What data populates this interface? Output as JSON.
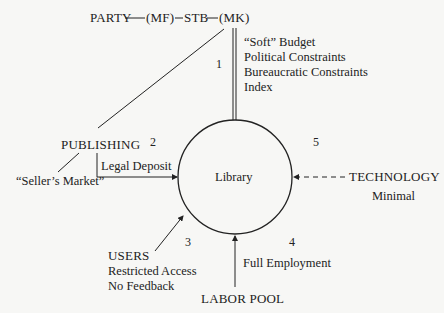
{
  "top_chain": {
    "party": "PARTY",
    "mf": "(MF)",
    "stb": "STB",
    "mk": "(MK)"
  },
  "sector_numbers": {
    "n1": "1",
    "n2": "2",
    "n3": "3",
    "n4": "4",
    "n5": "5"
  },
  "center": {
    "label": "Library"
  },
  "state_inputs": {
    "items": [
      "“Soft” Budget",
      "Political Constraints",
      "Bureaucratic Constraints",
      "Index"
    ]
  },
  "publishing": {
    "label": "PUBLISHING",
    "market": "“Seller’s Market”",
    "channel": "Legal Deposit"
  },
  "technology": {
    "label": "TECHNOLOGY",
    "note": "Minimal"
  },
  "users": {
    "label": "USERS",
    "note1": "Restricted Access",
    "note2": "No Feedback"
  },
  "labor": {
    "label": "LABOR POOL",
    "note": "Full Employment"
  },
  "colors": {
    "stroke": "#222222",
    "background": "#f7f7f5"
  }
}
